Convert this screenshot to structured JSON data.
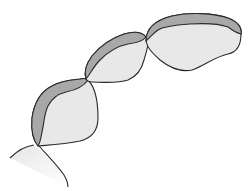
{
  "diagram": {
    "title": "",
    "colors": {
      "background": "#ffffff",
      "outline": "#2a2a2a",
      "band_fill": "#a8a8a8",
      "body_fill": "#e8e8e8",
      "base_fill": "#f2f2f2"
    },
    "segments": [
      {
        "id": "segment-lower",
        "label": ""
      },
      {
        "id": "segment-middle",
        "label": ""
      },
      {
        "id": "segment-upper",
        "label": ""
      },
      {
        "id": "segment-base",
        "label": ""
      }
    ]
  }
}
